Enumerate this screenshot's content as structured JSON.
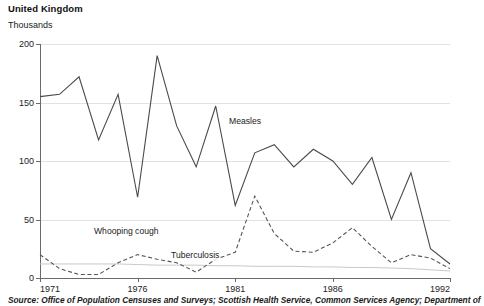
{
  "header": {
    "title": "United Kingdom",
    "unit_label": "Thousands"
  },
  "source": {
    "text": "Source: Office of Population Censuses and Surveys; Scottish Health Service, Common Services Agency; Department of"
  },
  "axes": {
    "y_ticks": [
      "0",
      "50",
      "100",
      "150",
      "200"
    ],
    "x_ticks": [
      "1971",
      "1976",
      "1981",
      "1986",
      "1992"
    ]
  },
  "labels": {
    "measles": "Measles",
    "whooping_cough": "Whooping cough",
    "tuberculosis": "Tuberculosis"
  },
  "colors": {
    "measles": "#4a4a4a",
    "whooping_cough": "#555555",
    "tuberculosis": "#c9c9c9",
    "grid": "#e2e2e2",
    "axis": "#6a6a6a"
  },
  "chart_data": {
    "type": "line",
    "title": "United Kingdom",
    "xlabel": "",
    "ylabel": "Thousands",
    "xlim": [
      1971,
      1992
    ],
    "ylim": [
      0,
      200
    ],
    "grid": true,
    "legend": "inline-annotations",
    "x": [
      1971,
      1972,
      1973,
      1974,
      1975,
      1976,
      1977,
      1978,
      1979,
      1980,
      1981,
      1982,
      1983,
      1984,
      1985,
      1986,
      1987,
      1988,
      1989,
      1990,
      1991,
      1992
    ],
    "series": [
      {
        "name": "Measles",
        "style": "solid",
        "values": [
          155,
          157,
          172,
          118,
          157,
          69,
          190,
          130,
          95,
          147,
          62,
          107,
          114,
          95,
          110,
          100,
          80,
          103,
          50,
          90,
          25,
          12
        ]
      },
      {
        "name": "Whooping cough",
        "style": "dashed",
        "values": [
          20,
          8,
          3,
          3,
          13,
          20,
          16,
          13,
          5,
          16,
          22,
          70,
          38,
          23,
          22,
          30,
          43,
          27,
          13,
          20,
          17,
          8
        ]
      },
      {
        "name": "Tuberculosis",
        "style": "solid-light",
        "values": [
          12,
          12,
          12,
          12,
          12,
          11.5,
          11,
          11,
          11,
          10.5,
          10.5,
          10,
          10,
          10,
          9.5,
          9.5,
          9,
          9,
          8.5,
          8,
          7,
          6
        ]
      }
    ]
  }
}
